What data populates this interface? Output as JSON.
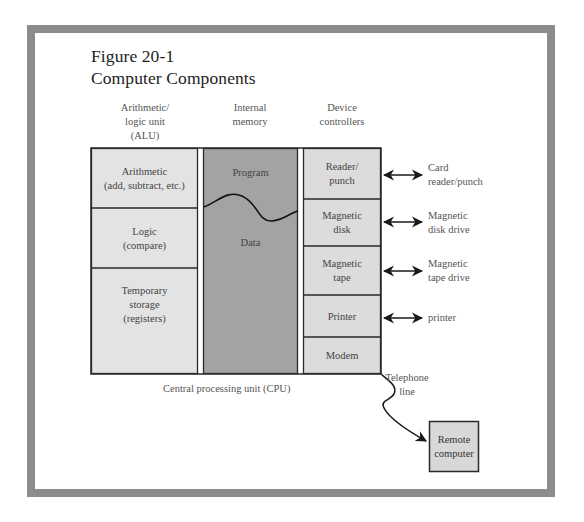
{
  "figure": {
    "number": "Figure 20-1",
    "title": "Computer Components"
  },
  "columns": {
    "alu": {
      "header": [
        "Arithmetic/",
        "logic unit",
        "(ALU)"
      ]
    },
    "memory": {
      "header": [
        "Internal",
        "memory"
      ]
    },
    "devices": {
      "header": [
        "Device",
        "controllers"
      ]
    }
  },
  "alu_cells": [
    {
      "lines": [
        "Arithmetic",
        "(add, subtract, etc.)"
      ]
    },
    {
      "lines": [
        "Logic",
        "(compare)"
      ]
    },
    {
      "lines": [
        "Temporary",
        "storage",
        "(registers)"
      ]
    }
  ],
  "memory_cells": {
    "program": "Program",
    "data": "Data"
  },
  "device_cells": [
    {
      "lines": [
        "Reader/",
        "punch"
      ]
    },
    {
      "lines": [
        "Magnetic",
        "disk"
      ]
    },
    {
      "lines": [
        "Magnetic",
        "tape"
      ]
    },
    {
      "lines": [
        "Printer"
      ]
    },
    {
      "lines": [
        "Modem"
      ]
    }
  ],
  "peripherals": [
    {
      "lines": [
        "Card",
        "reader/punch"
      ]
    },
    {
      "lines": [
        "Magnetic",
        "disk drive"
      ]
    },
    {
      "lines": [
        "Magnetic",
        "tape drive"
      ]
    },
    {
      "lines": [
        "printer"
      ]
    }
  ],
  "cpu_label": "Central processing unit (CPU)",
  "telephone_label": [
    "Telephone",
    "line"
  ],
  "remote": {
    "lines": [
      "Remote",
      "computer"
    ]
  },
  "colors": {
    "frame": "#8c8c8c",
    "light_fill": "#e3e3e3",
    "memory_fill": "#a3a3a3",
    "stroke": "#2a2a2a"
  }
}
